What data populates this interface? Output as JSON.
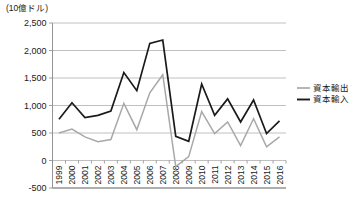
{
  "chart_data": {
    "type": "line",
    "title": "",
    "subtitle": "",
    "xlabel": "",
    "ylabel": "(10億ドル)",
    "unit_note": "(10億ドル)",
    "ylim": [
      -500,
      2500
    ],
    "ytick_step": 500,
    "grid": true,
    "legend_position": "right",
    "categories": [
      "1999",
      "2000",
      "2001",
      "2002",
      "2003",
      "2004",
      "2005",
      "2006",
      "2007",
      "2008",
      "2009",
      "2010",
      "2011",
      "2012",
      "2013",
      "2014",
      "2015",
      "2016"
    ],
    "ytick_labels": [
      "2,500",
      "2,000",
      "1,500",
      "1,000",
      "500",
      "0",
      "-500"
    ],
    "ytick_values": [
      2500,
      2000,
      1500,
      1000,
      500,
      0,
      -500
    ],
    "series": [
      {
        "name": "資本輸出",
        "color": "#a8a8a8",
        "values": [
          500,
          570,
          430,
          340,
          380,
          1040,
          560,
          1230,
          1560,
          -110,
          70,
          890,
          490,
          700,
          270,
          760,
          250,
          430
        ]
      },
      {
        "name": "資本輸入",
        "color": "#1a1a1a",
        "values": [
          750,
          1050,
          780,
          820,
          900,
          1600,
          1270,
          2130,
          2190,
          440,
          350,
          1390,
          820,
          1120,
          700,
          1100,
          490,
          720
        ]
      }
    ]
  },
  "legend": {
    "items": [
      {
        "label": "資本輸出",
        "color": "#a8a8a8"
      },
      {
        "label": "資本輸入",
        "color": "#1a1a1a"
      }
    ]
  }
}
